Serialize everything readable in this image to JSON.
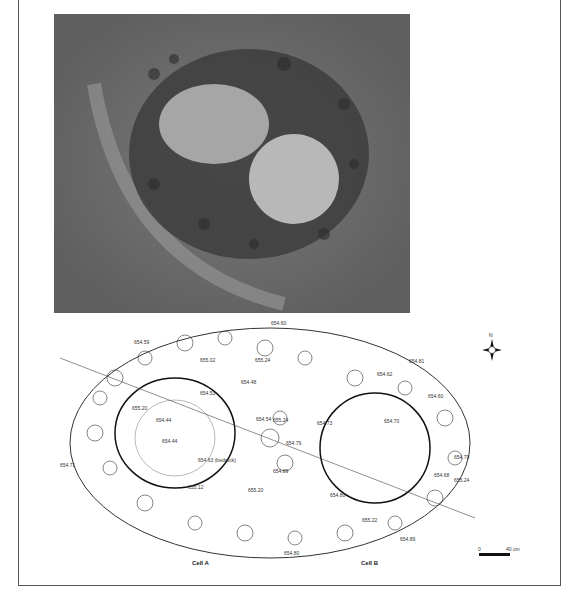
{
  "figure": {
    "photo": {
      "description": "aerial photograph of stone-lined double cell structure"
    },
    "plan": {
      "cells": [
        {
          "name": "Cell A"
        },
        {
          "name": "Cell B"
        }
      ],
      "elevations": [
        "654.60",
        "654.59",
        "655.02",
        "655.24",
        "654.48",
        "654.53",
        "655.20",
        "654.44",
        "654.54",
        "655.24",
        "654.79",
        "654.73",
        "654.62",
        "654.81",
        "654.60",
        "654.70",
        "654.44",
        "654.63 (bedrock)",
        "654.71",
        "655.12",
        "655.20",
        "654.89",
        "654.79",
        "654.68",
        "655.24",
        "654.80",
        "655.22",
        "654.89",
        "654.80"
      ],
      "north_label": "N",
      "scale": {
        "start": "0",
        "end": "40 cm"
      }
    }
  }
}
